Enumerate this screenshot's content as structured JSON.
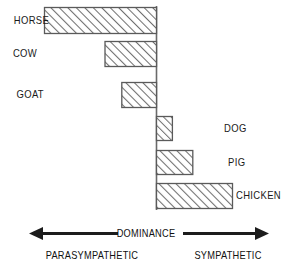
{
  "chart_data": {
    "type": "bar",
    "orientation": "horizontal",
    "title": "",
    "subtitle": "",
    "xlabel": "DOMINANCE",
    "ylabel": "",
    "grid": false,
    "legend": null,
    "axis_left_label": "PARASYMPATHETIC",
    "axis_right_label": "SYMPATHETIC",
    "xlim": [
      -1.0,
      0.72
    ],
    "zero_line": 0,
    "categories": [
      "HORSE",
      "COW",
      "GOAT",
      "DOG",
      "PIG",
      "CHICKEN"
    ],
    "values": [
      -1.0,
      -0.46,
      -0.31,
      0.14,
      0.32,
      0.67
    ],
    "series": [
      {
        "name": "Dominance",
        "values": [
          -1.0,
          -0.46,
          -0.31,
          0.14,
          0.32,
          0.67
        ]
      }
    ],
    "bars": [
      {
        "label": "HORSE",
        "value": -1.0,
        "side": "left",
        "label_side": "left"
      },
      {
        "label": "COW",
        "value": -0.46,
        "side": "left",
        "label_side": "left"
      },
      {
        "label": "GOAT",
        "value": -0.31,
        "side": "left",
        "label_side": "left"
      },
      {
        "label": "DOG",
        "value": 0.14,
        "side": "right",
        "label_side": "right"
      },
      {
        "label": "PIG",
        "value": 0.32,
        "side": "right",
        "label_side": "right"
      },
      {
        "label": "CHICKEN",
        "value": 0.67,
        "side": "right",
        "label_side": "right"
      }
    ],
    "annotations": [
      "DOMINANCE",
      "PARASYMPATHETIC",
      "SYMPATHETIC"
    ]
  },
  "labels": {
    "horse": "HORSE",
    "cow": "COW",
    "goat": "GOAT",
    "dog": "DOG",
    "pig": "PIG",
    "chicken": "CHICKEN"
  },
  "axis": {
    "dominance": "DOMINANCE",
    "parasympathetic": "PARASYMPATHETIC",
    "sympathetic": "SYMPATHETIC"
  },
  "colors": {
    "bar_outline": "#555555",
    "bar_hatch": "#777777",
    "bar_fill": "#ffffff",
    "axis_line": "#666666",
    "arrow": "#1c1c1c",
    "text": "#141414",
    "background": "#ffffff"
  }
}
